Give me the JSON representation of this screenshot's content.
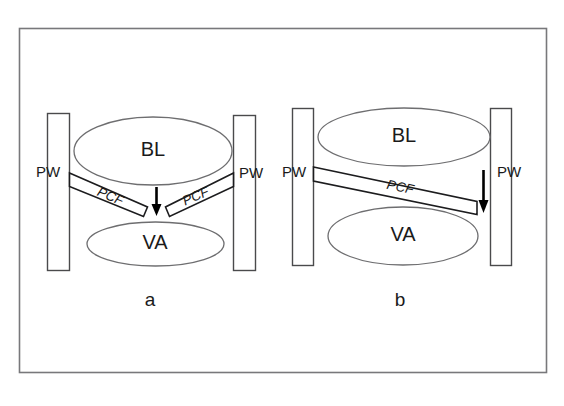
{
  "figure": {
    "background_color": "#ffffff",
    "border_color": "#78787b",
    "panels": [
      {
        "id": "a",
        "caption": "a",
        "zones": [
          {
            "name": "BL",
            "label": "BL"
          },
          {
            "name": "VA",
            "label": "VA"
          }
        ],
        "walls": [
          {
            "name": "left-wall",
            "label": "PW"
          },
          {
            "name": "right-wall",
            "label": "PW"
          }
        ],
        "bands": [
          {
            "name": "left-band",
            "label": "PCF"
          },
          {
            "name": "right-band",
            "label": "PCF"
          }
        ],
        "arrows": [
          {
            "name": "center-flow-arrow",
            "direction": "down"
          }
        ]
      },
      {
        "id": "b",
        "caption": "b",
        "zones": [
          {
            "name": "BL",
            "label": "BL"
          },
          {
            "name": "VA",
            "label": "VA"
          }
        ],
        "walls": [
          {
            "name": "left-wall",
            "label": "PW"
          },
          {
            "name": "right-wall",
            "label": "PW"
          }
        ],
        "bands": [
          {
            "name": "main-band",
            "label": "PCF"
          }
        ],
        "arrows": [
          {
            "name": "right-flow-arrow",
            "direction": "down"
          }
        ]
      }
    ]
  }
}
